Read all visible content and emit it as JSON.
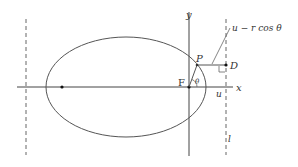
{
  "diagram": {
    "labels": {
      "y_axis": "y",
      "x_axis": "x",
      "focus": "F",
      "point": "P",
      "foot": "D",
      "angle": "θ",
      "u_tick": "u",
      "directrix": "l",
      "distance": "u − r cos θ"
    },
    "colors": {
      "stroke": "#555555",
      "text": "#333333",
      "point": "#111111"
    }
  }
}
